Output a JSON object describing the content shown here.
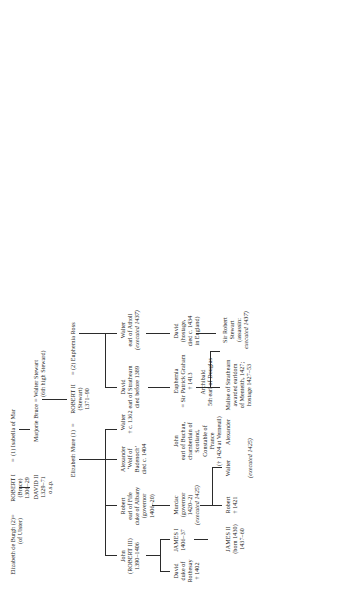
{
  "chart": {
    "type": "family-tree"
  },
  "nodes": {
    "elizabeth_de_burgh": {
      "l1": "Elizabeth de Burgh (2)",
      "l2": "(of Ulster)"
    },
    "robert_i": {
      "l1": "ROBERT I",
      "l2": "(Bruce)",
      "l3": "1306–29"
    },
    "isabella_of_mar": {
      "l1": "(1) Isabella of Mar"
    },
    "david_ii": {
      "l1": "DAVID II",
      "l2": "1329–71",
      "l3": "o.s.p."
    },
    "marjorie_bruce": {
      "l1": "Marjorie Bruce"
    },
    "walter_stewart": {
      "l1": "Walter Stewart",
      "l2": "(6th high Steward)"
    },
    "elizabeth_mure": {
      "l1": "Elizabeth Mure (1)"
    },
    "robert_ii": {
      "l1": "ROBERT II",
      "l2": "(Stewart)",
      "l3": "1371–90"
    },
    "euphemia_ross": {
      "l1": "(2) Euphemia Ross"
    },
    "john_robert_iii": {
      "l1": "John",
      "l2": "(ROBERT III)",
      "l3": "1390–1406"
    },
    "robert_fife": {
      "l1": "Robert",
      "l2": "earl of Fife",
      "l3": "duke of Albany",
      "l4": "(governor",
      "l5": "1406–20)"
    },
    "alexander_wolf": {
      "l1": "Alexander",
      "l2": "‘Wolf of",
      "l3": "Badenoch’",
      "l4": "died c. 1404"
    },
    "david_strathearn": {
      "l1": "David",
      "l2": "earl of Strathearn",
      "l3": "died before 1389"
    },
    "walter_atholl": {
      "l1": "Walter",
      "l2": "earl of Atholl",
      "l3": "(executed 1437)"
    },
    "david_rothesay": {
      "l1": "David",
      "l2": "duke of",
      "l3": "Rothesay",
      "l4": "† 1402"
    },
    "james_i": {
      "l1": "JAMES I",
      "l2": "1406–37"
    },
    "walter_1362": {
      "l1": "Walter",
      "l2": "† c. 1362"
    },
    "murdac": {
      "l1": "Murdac",
      "l2": "(governor",
      "l3": "1420–2)",
      "l4": "(executed 1425)"
    },
    "john_buchan": {
      "l1": "John",
      "l2": "earl of Buchan,",
      "l3": "chamberlain of",
      "l4": "Scotland,",
      "l5": "Constable of",
      "l6": "France",
      "l7": "(† 1424 at Verneuil)"
    },
    "euphemia_graham": {
      "l1": "Euphemia",
      "l2": "= Sir Patrick Graham",
      "l3": "† 1413"
    },
    "david_hostage": {
      "l1": "David",
      "l2": "(hostage,",
      "l3": "died c. 1434",
      "l4": "in England)"
    },
    "james_ii": {
      "l1": "JAMES II",
      "l2": "(born 1430)",
      "l3": "1437–60"
    },
    "robert_1421": {
      "l1": "Robert",
      "l2": "† 1421"
    },
    "walter_exec": {
      "l1": "Walter"
    },
    "alexander_exec": {
      "l1": "Alexander"
    },
    "alexander_note": {
      "l1": "(executed 1425)"
    },
    "malise": {
      "l1": "Malise of Strathearn",
      "l2": "awarded earldom",
      "l3": "of Menteith, 1427;",
      "l4": "hostage 1427–53"
    },
    "archibald": {
      "l1": "Archibald",
      "l2": "5th earl of Douglas"
    },
    "sir_robert_stewart": {
      "l1": "Sir Robert",
      "l2": "Stewart",
      "l3": "(assassin:",
      "l4": "executed 1437)"
    }
  }
}
